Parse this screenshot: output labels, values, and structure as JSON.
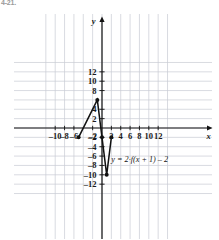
{
  "figure": {
    "corner_label": "4-21.",
    "background_color": "#ffffff",
    "grid_color": "#c9ccd4",
    "axis_color": "#111111",
    "curve_color": "#111111"
  },
  "chart_data": {
    "type": "line",
    "title": "",
    "subtitle": "",
    "xlabel": "x",
    "ylabel": "y",
    "xlim": [
      -11.5,
      13.8
    ],
    "ylim": [
      -13.5,
      13.5
    ],
    "grid": true,
    "grid_step": 2,
    "legend_position": "none",
    "x_ticks": [
      -10,
      -8,
      -6,
      -2,
      2,
      4,
      6,
      8,
      10,
      12
    ],
    "x_tick_labels": [
      "–10",
      "–8",
      "–6",
      "–2",
      "2",
      "4",
      "6",
      "8",
      "10",
      "12"
    ],
    "y_ticks": [
      12,
      10,
      8,
      4,
      2,
      -2,
      -4,
      -6,
      -8,
      -10,
      -12
    ],
    "y_tick_labels": [
      "12",
      "10",
      "8",
      "4",
      "2",
      "–2",
      "–4",
      "–6",
      "–8",
      "–10",
      "–12"
    ],
    "annotations": [
      {
        "text": "y = 2·f(x + 1) – 2",
        "x": 2.0,
        "y": -6.6
      }
    ],
    "series": [
      {
        "name": "y = 2·f(x + 1) – 2",
        "points": [
          {
            "x": -5,
            "y": -2,
            "marker": true
          },
          {
            "x": -1,
            "y": 6,
            "marker": true
          },
          {
            "x": 0,
            "y": -2,
            "marker": true
          },
          {
            "x": 1,
            "y": -10,
            "marker": true
          },
          {
            "x": 2,
            "y": -2,
            "marker": true
          }
        ]
      }
    ]
  }
}
